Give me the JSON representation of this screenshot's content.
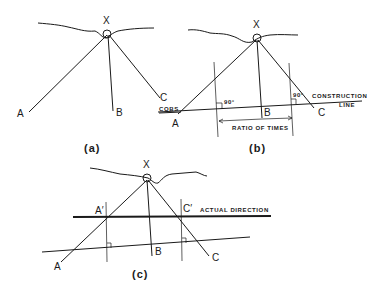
{
  "diagram": {
    "panels": [
      {
        "caption": "(a)",
        "labels": {
          "apex": "X",
          "a": "A",
          "b": "B",
          "c": "C"
        }
      },
      {
        "caption": "(b)",
        "labels": {
          "apex": "X",
          "a": "A",
          "b": "B",
          "c": "C",
          "cobs": "COBS",
          "angle_left": "90°",
          "angle_right": "90°",
          "construction_line_1": "CONSTRUCTION",
          "construction_line_2": "LINE",
          "ratio": "RATIO OF TIMES"
        }
      },
      {
        "caption": "(c)",
        "labels": {
          "apex": "X",
          "a": "A",
          "b": "B",
          "c": "C",
          "a_prime": "A′",
          "c_prime": "C′",
          "actual_direction": "ACTUAL DIRECTION"
        }
      }
    ]
  }
}
